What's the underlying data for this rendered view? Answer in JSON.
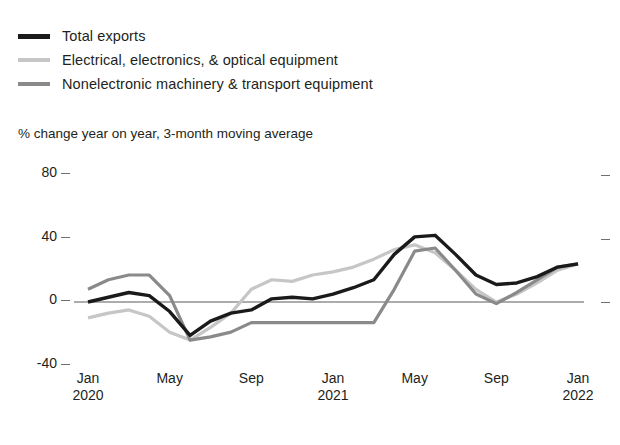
{
  "legend": {
    "items": [
      {
        "label": "Total exports",
        "color": "#1a1a1a",
        "key": "total"
      },
      {
        "label": "Electrical, electronics, & optical equipment",
        "color": "#c6c6c6",
        "key": "electrical"
      },
      {
        "label": "Nonelectronic machinery & transport equipment",
        "color": "#8a8a8a",
        "key": "nonelectronic"
      }
    ]
  },
  "axis_note": "% change year on year, 3-month moving average",
  "chart_data": {
    "type": "line",
    "title": "",
    "subtitle": "% change year on year, 3-month moving average",
    "xlabel": "",
    "ylabel": "% change year on year, 3-month moving average",
    "ylim": [
      -40,
      80
    ],
    "yticks": [
      -40,
      0,
      40,
      80
    ],
    "ytick_labels": [
      "-40",
      "0",
      "40",
      "80"
    ],
    "grid": false,
    "zero_line": true,
    "legend_position": "top-left",
    "right_axis_ticks": [
      0,
      40,
      80
    ],
    "x": [
      "Jan 2020",
      "Feb 2020",
      "Mar 2020",
      "Apr 2020",
      "May 2020",
      "Jun 2020",
      "Jul 2020",
      "Aug 2020",
      "Sep 2020",
      "Oct 2020",
      "Nov 2020",
      "Dec 2020",
      "Jan 2021",
      "Feb 2021",
      "Mar 2021",
      "Apr 2021",
      "May 2021",
      "Jun 2021",
      "Jul 2021",
      "Aug 2021",
      "Sep 2021",
      "Oct 2021",
      "Nov 2021",
      "Dec 2021",
      "Jan 2022"
    ],
    "xtick_labels": [
      {
        "month": "Jan",
        "year": "2020"
      },
      {
        "month": "May",
        "year": ""
      },
      {
        "month": "Sep",
        "year": ""
      },
      {
        "month": "Jan",
        "year": "2021"
      },
      {
        "month": "May",
        "year": ""
      },
      {
        "month": "Sep",
        "year": ""
      },
      {
        "month": "Jan",
        "year": "2022"
      }
    ],
    "series": [
      {
        "name": "Total exports",
        "color": "#1a1a1a",
        "width": 3.4,
        "values": [
          0,
          3,
          6,
          4,
          -6,
          -21,
          -12,
          -7,
          -5,
          2,
          3,
          2,
          5,
          9,
          14,
          30,
          41,
          42,
          30,
          17,
          11,
          12,
          16,
          22,
          24
        ]
      },
      {
        "name": "Electrical, electronics, & optical equipment",
        "color": "#c6c6c6",
        "width": 3.2,
        "values": [
          -10,
          -7,
          -5,
          -9,
          -19,
          -24,
          -16,
          -7,
          8,
          14,
          13,
          17,
          19,
          22,
          27,
          33,
          36,
          31,
          20,
          8,
          0,
          5,
          12,
          20,
          24
        ]
      },
      {
        "name": "Nonelectronic machinery & transport equipment",
        "color": "#8a8a8a",
        "width": 3.2,
        "values": [
          8,
          14,
          17,
          17,
          4,
          -24,
          -22,
          -19,
          -13,
          -13,
          -13,
          -13,
          -13,
          -13,
          -13,
          8,
          32,
          34,
          20,
          5,
          -1,
          6,
          14,
          22,
          24
        ]
      }
    ]
  },
  "plot_geometry": {
    "x_start": 88,
    "x_end": 578,
    "y_top_value": 80,
    "y_top_px": 175,
    "y_zero_px": 302,
    "y_bottom_value": -40,
    "y_bottom_px": 360
  }
}
